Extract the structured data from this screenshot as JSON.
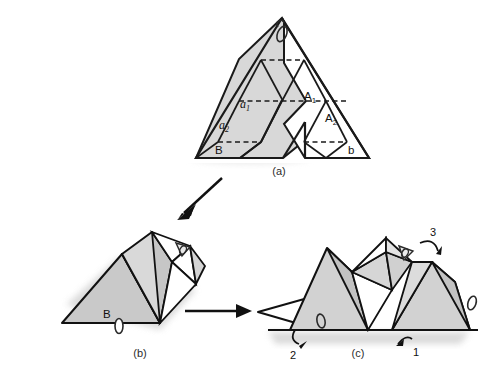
{
  "figure": {
    "title": "",
    "background": "#ffffff",
    "colors": {
      "shade_gray": "#d5d5d5",
      "shade_gray_dark": "#bdbdbd",
      "shade_gray_mid": "#c8c8c8",
      "white_face": "#ffffff",
      "outline": "#111111",
      "dashed_crease": "#333333",
      "shadow": "#c9c9c9",
      "text": "#1a1a1a"
    },
    "panels": [
      {
        "id": "panel-a",
        "caption": "(a)",
        "description": "chevron triangular-grid net",
        "labels": [
          {
            "name": "label-a1",
            "text": "a",
            "sub": "1",
            "style": "italic-lower"
          },
          {
            "name": "label-a2",
            "text": "a",
            "sub": "2",
            "style": "italic-lower"
          },
          {
            "name": "label-B",
            "text": "B",
            "sub": "",
            "style": "upright-upper"
          },
          {
            "name": "label-A1",
            "text": "A",
            "sub": "1",
            "style": "upright-upper"
          },
          {
            "name": "label-A2",
            "text": "A",
            "sub": "2",
            "style": "upright-upper"
          },
          {
            "name": "label-b",
            "text": "b",
            "sub": "",
            "style": "upright-lower"
          }
        ],
        "clips": [
          "apex-clip"
        ]
      },
      {
        "id": "panel-b",
        "caption": "(b)",
        "description": "partially folded three-dimensional form",
        "labels": [
          {
            "name": "label-B",
            "text": "B",
            "sub": "",
            "style": "upright-upper"
          }
        ],
        "clips": [
          "base-clip",
          "top-clip"
        ]
      },
      {
        "id": "panel-c",
        "caption": "(c)",
        "description": "assembled multi-peak folded form with fold-direction callouts",
        "labels": [],
        "clips": [
          "left-clip",
          "middle-clip",
          "right-clip"
        ],
        "callouts": [
          {
            "name": "callout-1",
            "text": "1"
          },
          {
            "name": "callout-2",
            "text": "2"
          },
          {
            "name": "callout-3",
            "text": "3"
          }
        ]
      }
    ],
    "flow_arrows": [
      {
        "name": "arrow-a-to-b",
        "direction": "down-left"
      },
      {
        "name": "arrow-b-to-c",
        "direction": "right"
      }
    ]
  }
}
